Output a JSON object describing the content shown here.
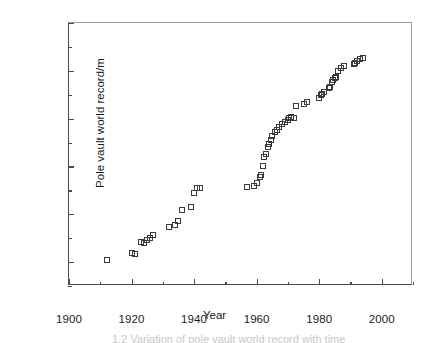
{
  "chart_data": {
    "type": "scatter",
    "title": "",
    "xlabel": "Year",
    "ylabel": "Pole vault world record/m",
    "xlim": [
      1900,
      2010
    ],
    "ylim": [
      3.75,
      6.5
    ],
    "grid": false,
    "legend": null,
    "marker": "open-square",
    "marker_color": "#3a3a3a",
    "x_ticks_major": [
      1900,
      1920,
      1940,
      1960,
      1980,
      2000
    ],
    "x_tick_labels": [
      "1900",
      "1920",
      "1940",
      "1960",
      "1980",
      "2000"
    ],
    "x_ticks_minor": [
      1910,
      1930,
      1950,
      1970,
      1990,
      2010
    ],
    "y_ticks_major": [
      4.0,
      4.5,
      5.0,
      5.5,
      6.0,
      6.5
    ],
    "y_tick_labels": [
      "4.0",
      "4.5",
      "5.0",
      "5.5",
      "6.0",
      "6.5"
    ],
    "y_ticks_minor": [
      3.75,
      4.25,
      4.75,
      5.25,
      5.75,
      6.25
    ],
    "x": [
      1912,
      1920,
      1921,
      1923,
      1924,
      1925,
      1926,
      1927,
      1932,
      1934,
      1935,
      1936,
      1939,
      1940,
      1941,
      1942,
      1957,
      1959,
      1960,
      1961,
      1961.5,
      1962,
      1962.5,
      1963,
      1963.5,
      1964,
      1964.5,
      1965,
      1966,
      1966.5,
      1967,
      1968,
      1969,
      1970,
      1970.5,
      1971,
      1972,
      1972.5,
      1975,
      1976,
      1980,
      1980.5,
      1981,
      1981.5,
      1983,
      1983.5,
      1984,
      1984.5,
      1985,
      1985.5,
      1986,
      1987,
      1988,
      1991,
      1991.5,
      1992,
      1993,
      1994
    ],
    "y": [
      4.02,
      4.09,
      4.08,
      4.21,
      4.2,
      4.23,
      4.25,
      4.28,
      4.37,
      4.39,
      4.43,
      4.54,
      4.58,
      4.72,
      4.77,
      4.77,
      4.78,
      4.8,
      4.83,
      4.89,
      4.91,
      5.0,
      5.1,
      5.13,
      5.2,
      5.23,
      5.28,
      5.32,
      5.36,
      5.38,
      5.41,
      5.44,
      5.46,
      5.49,
      5.51,
      5.52,
      5.51,
      5.63,
      5.65,
      5.67,
      5.72,
      5.75,
      5.76,
      5.78,
      5.82,
      5.83,
      5.88,
      5.9,
      5.92,
      5.94,
      6.0,
      6.03,
      6.05,
      6.07,
      6.08,
      6.1,
      6.12,
      6.13
    ]
  },
  "axes": {
    "x_title": "Year",
    "y_title": "Pole vault world record/m"
  },
  "caption": {
    "text": "1.2 Variation of pole vault world record with time"
  }
}
